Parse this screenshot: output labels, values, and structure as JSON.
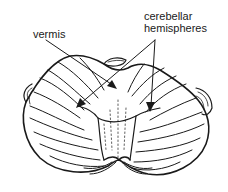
{
  "diagram": {
    "labels": {
      "vermis": "vermis",
      "hemispheres_line1": "cerebellar",
      "hemispheres_line2": "hemispheres"
    },
    "colors": {
      "background": "#ffffff",
      "ink": "#1a1a1a"
    }
  }
}
